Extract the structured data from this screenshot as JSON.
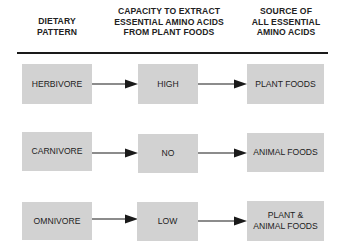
{
  "headers": [
    {
      "lines": [
        "DIETARY",
        "PATTERN"
      ]
    },
    {
      "lines": [
        "CAPACITY TO EXTRACT",
        "ESSENTIAL AMINO ACIDS",
        "FROM PLANT FOODS"
      ]
    },
    {
      "lines": [
        "SOURCE OF",
        "ALL ESSENTIAL",
        "AMINO ACIDS"
      ]
    }
  ],
  "rows": [
    {
      "pattern": "HERBIVORE",
      "capacity": "HIGH",
      "source": [
        "PLANT FOODS"
      ]
    },
    {
      "pattern": "CARNIVORE",
      "capacity": "NO",
      "source": [
        "ANIMAL FOODS"
      ]
    },
    {
      "pattern": "OMNIVORE",
      "capacity": "LOW",
      "source": [
        "PLANT &",
        "ANIMAL FOODS"
      ]
    }
  ],
  "colors": {
    "box_fill": "#d2d2d2",
    "line": "#1a1a1a"
  }
}
